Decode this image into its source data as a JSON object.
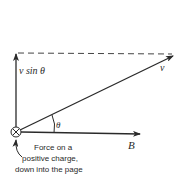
{
  "diagram": {
    "labels": {
      "v_sin_theta": "v sin θ",
      "v": "v",
      "theta": "θ",
      "B": "B"
    },
    "caption": {
      "line1": "Force on a",
      "line2": "positive charge,",
      "line3": "down into the page"
    },
    "colors": {
      "ink": "#2a2a2a",
      "background": "#ffffff"
    }
  }
}
